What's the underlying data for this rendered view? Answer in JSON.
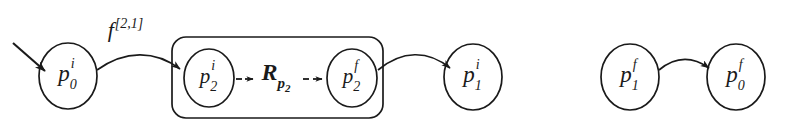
{
  "figure": {
    "background_color": "#ffffff",
    "stroke_color": "#1a1a1a",
    "width": 785,
    "height": 125
  },
  "nodes": [
    {
      "id": "p0i",
      "base": "p",
      "sup": "i",
      "sub": "0",
      "cx": 68,
      "cy": 76,
      "rx": 29,
      "ry": 33
    },
    {
      "id": "p2i",
      "base": "p",
      "sup": "i",
      "sub": "2",
      "cx": 209,
      "cy": 78,
      "rx": 25,
      "ry": 29
    },
    {
      "id": "p2f",
      "base": "p",
      "sup": "f",
      "sub": "2",
      "cx": 352,
      "cy": 78,
      "rx": 25,
      "ry": 29
    },
    {
      "id": "p1i",
      "base": "p",
      "sup": "i",
      "sub": "1",
      "cx": 473,
      "cy": 77,
      "rx": 29,
      "ry": 33
    },
    {
      "id": "p1f",
      "base": "p",
      "sup": "f",
      "sub": "1",
      "cx": 630,
      "cy": 77,
      "rx": 29,
      "ry": 33
    },
    {
      "id": "p0f",
      "base": "p",
      "sup": "f",
      "sub": "0",
      "cx": 736,
      "cy": 77,
      "rx": 29,
      "ry": 33
    }
  ],
  "labels": {
    "edge_f": {
      "base": "f",
      "sup": "[2,1]",
      "x": 125,
      "y": 30
    },
    "relation": {
      "base": "R",
      "sub_base": "p",
      "sub_script": "2",
      "x": 276,
      "y": 72
    }
  },
  "group_box": {
    "name": "refinement-block",
    "x": 172,
    "y": 37,
    "width": 211,
    "height": 81,
    "radius": 14
  },
  "edges": [
    {
      "id": "entry-arrow",
      "from": "external",
      "to": "p0i",
      "style": "solid-straight"
    },
    {
      "id": "p0i-to-p2i",
      "from": "p0i",
      "to": "p2i",
      "style": "solid-curved",
      "label": "edge_f"
    },
    {
      "id": "p2i-to-R",
      "from": "p2i",
      "to": "relation",
      "style": "dashed-short"
    },
    {
      "id": "R-to-p2f",
      "from": "relation",
      "to": "p2f",
      "style": "dashed-short"
    },
    {
      "id": "p2f-to-p1i",
      "from": "p2f",
      "to": "p1i",
      "style": "solid-curved"
    },
    {
      "id": "p1f-to-p0f",
      "from": "p1f",
      "to": "p0f",
      "style": "solid-curved"
    }
  ]
}
